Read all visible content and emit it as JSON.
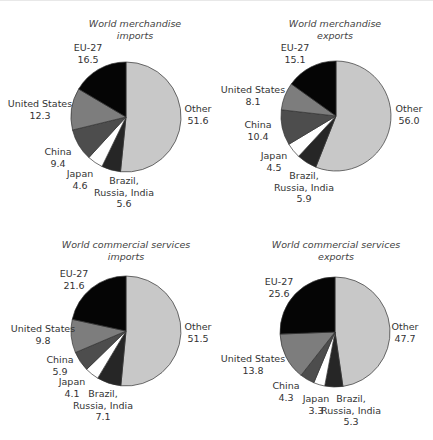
{
  "colors": {
    "Other": "#c8c8c8",
    "Brazil, Russia, India": "#262626",
    "Japan": "#ffffff",
    "China": "#4d4d4d",
    "United States": "#7d7d7d",
    "EU-27": "#050505",
    "stroke": "#333333"
  },
  "chart_data": [
    {
      "type": "pie",
      "title": "World merchandise imports",
      "title_lines": [
        "World merchandise",
        "imports"
      ],
      "slices": [
        {
          "label": "Other",
          "value": 51.6
        },
        {
          "label": "Brazil, Russia, India",
          "value": 5.6
        },
        {
          "label": "Japan",
          "value": 4.6
        },
        {
          "label": "China",
          "value": 9.4
        },
        {
          "label": "United States",
          "value": 12.3
        },
        {
          "label": "EU-27",
          "value": 16.5
        }
      ]
    },
    {
      "type": "pie",
      "title": "World merchandise exports",
      "title_lines": [
        "World merchandise",
        "exports"
      ],
      "slices": [
        {
          "label": "Other",
          "value": 56.0
        },
        {
          "label": "Brazil, Russia, India",
          "value": 5.9
        },
        {
          "label": "Japan",
          "value": 4.5
        },
        {
          "label": "China",
          "value": 10.4
        },
        {
          "label": "United States",
          "value": 8.1
        },
        {
          "label": "EU-27",
          "value": 15.1
        }
      ]
    },
    {
      "type": "pie",
      "title": "World commercial services imports",
      "title_lines": [
        "World commercial services",
        "imports"
      ],
      "slices": [
        {
          "label": "Other",
          "value": 51.5
        },
        {
          "label": "Brazil, Russia, India",
          "value": 7.1
        },
        {
          "label": "Japan",
          "value": 4.1
        },
        {
          "label": "China",
          "value": 5.9
        },
        {
          "label": "United States",
          "value": 9.8
        },
        {
          "label": "EU-27",
          "value": 21.6
        }
      ]
    },
    {
      "type": "pie",
      "title": "World commercial services exports",
      "title_lines": [
        "World commercial services",
        "exports"
      ],
      "slices": [
        {
          "label": "Other",
          "value": 47.7
        },
        {
          "label": "Brazil, Russia, India",
          "value": 5.3
        },
        {
          "label": "Japan",
          "value": 3.3
        },
        {
          "label": "China",
          "value": 4.3
        },
        {
          "label": "United States",
          "value": 13.8
        },
        {
          "label": "EU-27",
          "value": 25.6
        }
      ]
    }
  ],
  "layout": {
    "panels": [
      {
        "left": 0,
        "top": 0,
        "cx": 126,
        "cy": 117,
        "r": 55,
        "title_x": 135,
        "title_y": 18,
        "labels": {
          "EU-27": {
            "x": 88,
            "y": 42,
            "lines": [
              "EU-27",
              "16.5"
            ]
          },
          "United States": {
            "x": 40,
            "y": 98,
            "lines": [
              "United States",
              "12.3"
            ]
          },
          "China": {
            "x": 58,
            "y": 146,
            "lines": [
              "China",
              "9.4"
            ]
          },
          "Japan": {
            "x": 80,
            "y": 168,
            "lines": [
              "Japan",
              "4.6"
            ]
          },
          "Brazil, Russia, India": {
            "x": 124,
            "y": 175,
            "lines": [
              "Brazil,",
              "Russia, India",
              "5.6"
            ]
          },
          "Other": {
            "x": 198,
            "y": 103,
            "lines": [
              "Other",
              "51.6"
            ]
          }
        }
      },
      {
        "left": 216,
        "top": 0,
        "cx": 120,
        "cy": 116,
        "r": 55,
        "title_x": 119,
        "title_y": 18,
        "labels": {
          "EU-27": {
            "x": 79,
            "y": 42,
            "lines": [
              "EU-27",
              "15.1"
            ]
          },
          "United States": {
            "x": 37,
            "y": 84,
            "lines": [
              "United States",
              "8.1"
            ]
          },
          "China": {
            "x": 42,
            "y": 119,
            "lines": [
              "China",
              "10.4"
            ]
          },
          "Japan": {
            "x": 58,
            "y": 150,
            "lines": [
              "Japan",
              "4.5"
            ]
          },
          "Brazil, Russia, India": {
            "x": 88,
            "y": 170,
            "lines": [
              "Brazil,",
              "Russia, India",
              "5.9"
            ]
          },
          "Other": {
            "x": 193,
            "y": 103,
            "lines": [
              "Other",
              "56.0"
            ]
          }
        }
      },
      {
        "left": 0,
        "top": 220,
        "cx": 126,
        "cy": 111,
        "r": 55,
        "title_x": 126,
        "title_y": 19,
        "labels": {
          "EU-27": {
            "x": 74,
            "y": 48,
            "lines": [
              "EU-27",
              "21.6"
            ]
          },
          "United States": {
            "x": 43,
            "y": 103,
            "lines": [
              "United States",
              "9.8"
            ]
          },
          "China": {
            "x": 60,
            "y": 134,
            "lines": [
              "China",
              "5.9"
            ]
          },
          "Japan": {
            "x": 72,
            "y": 156,
            "lines": [
              "Japan",
              "4.1"
            ]
          },
          "Brazil, Russia, India": {
            "x": 103,
            "y": 168,
            "lines": [
              "Brazil,",
              "Russia, India",
              "7.1"
            ]
          },
          "Other": {
            "x": 198,
            "y": 101,
            "lines": [
              "Other",
              "51.5"
            ]
          }
        }
      },
      {
        "left": 216,
        "top": 220,
        "cx": 119,
        "cy": 112,
        "r": 55,
        "title_x": 120,
        "title_y": 19,
        "labels": {
          "EU-27": {
            "x": 63,
            "y": 56,
            "lines": [
              "EU-27",
              "25.6"
            ]
          },
          "United States": {
            "x": 37,
            "y": 133,
            "lines": [
              "United States",
              "13.8"
            ]
          },
          "China": {
            "x": 70,
            "y": 160,
            "lines": [
              "China",
              "4.3"
            ]
          },
          "Japan": {
            "x": 100,
            "y": 173,
            "lines": [
              "Japan",
              "3.3"
            ]
          },
          "Brazil, Russia, India": {
            "x": 135,
            "y": 173,
            "lines": [
              "Brazil,",
              "Russia, India",
              "5.3"
            ]
          },
          "Other": {
            "x": 189,
            "y": 101,
            "lines": [
              "Other",
              "47.7"
            ]
          }
        }
      }
    ]
  }
}
